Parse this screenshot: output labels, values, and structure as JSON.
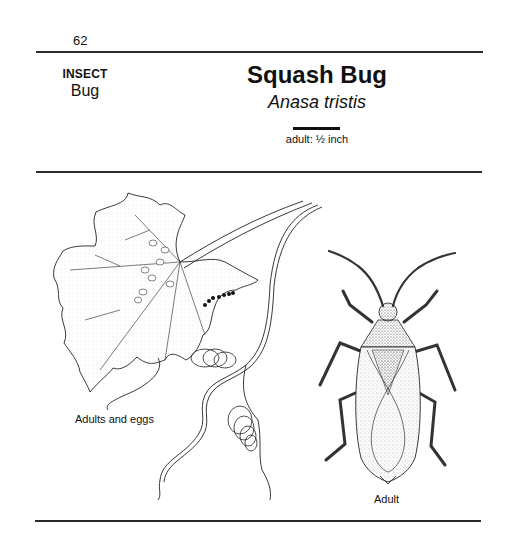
{
  "page": {
    "number": "62"
  },
  "header": {
    "category": "INSECT",
    "subcategory": "Bug",
    "title": "Squash Bug",
    "scientific_name": "Anasa tristis",
    "scale_label": "adult: ½ inch"
  },
  "illustrations": [
    {
      "name": "squash-leaf-with-adults-and-eggs",
      "caption": "Adults and eggs"
    },
    {
      "name": "adult-squash-bug",
      "caption": "Adult"
    }
  ],
  "colors": {
    "ink": "#111111",
    "rule": "#2a2a2a",
    "background": "#ffffff"
  }
}
